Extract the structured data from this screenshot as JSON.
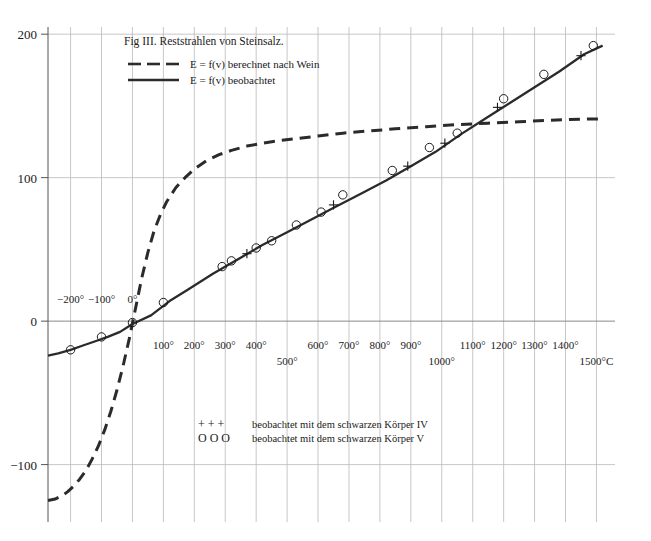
{
  "figure": {
    "title": "Fig III. Reststrahlen von Steinsalz.",
    "legend": [
      {
        "label": "E = f(v) berechnet nach Wein",
        "style": "dashed"
      },
      {
        "label": "E = f(v) beobachtet",
        "style": "solid"
      }
    ],
    "marker_legend": [
      {
        "glyphs": "+   +   +",
        "label": "beobachtet mit dem schwarzen Körper IV"
      },
      {
        "glyphs": "O   O   O",
        "label": "beobachtet mit dem schwarzen Körper V"
      }
    ],
    "axis_unit": "1500°C"
  },
  "chart_data": {
    "type": "line",
    "title": "Fig III. Reststrahlen von Steinsalz.",
    "xlabel": "",
    "ylabel": "",
    "xlim": [
      -273,
      1560
    ],
    "ylim": [
      -140,
      205
    ],
    "grid": true,
    "legend_position": "top-left",
    "y_ticks": [
      200,
      100,
      0,
      -100
    ],
    "y_tick_labels": [
      "200",
      "100",
      "0",
      "-100"
    ],
    "x_ticks": [
      -200,
      -100,
      0,
      100,
      200,
      300,
      400,
      500,
      600,
      700,
      800,
      900,
      1000,
      1100,
      1200,
      1300,
      1400,
      1500
    ],
    "x_tick_labels": [
      "−200°",
      "−100°",
      "0°",
      "100°",
      "200°",
      "300°",
      "400°",
      "500°",
      "600°",
      "700°",
      "800°",
      "900°",
      "1000°",
      "1100°",
      "1200°",
      "1300°",
      "1400°",
      "1500°C"
    ],
    "x_labels_above_axis": [
      "−200°",
      "−100°",
      "0°"
    ],
    "x_labels_staggered_low": [
      "500°",
      "1000°",
      "1500°C"
    ],
    "series": [
      {
        "name": "E = f(v) berechnet nach Wein",
        "style": "dashed",
        "x": [
          -273,
          -250,
          -230,
          -210,
          -190,
          -170,
          -150,
          -130,
          -110,
          -90,
          -70,
          -50,
          -30,
          -10,
          10,
          30,
          50,
          70,
          90,
          110,
          140,
          170,
          200,
          240,
          280,
          320,
          370,
          420,
          480,
          540,
          600,
          680,
          760,
          850,
          950,
          1050,
          1150,
          1250,
          1350,
          1450,
          1520
        ],
        "y": [
          -125,
          -124,
          -122,
          -119,
          -115,
          -110,
          -104,
          -96,
          -87,
          -76,
          -63,
          -48,
          -31,
          -12,
          9,
          30,
          48,
          63,
          74,
          83,
          93,
          100,
          106,
          112,
          116,
          119,
          122,
          124,
          126,
          127.5,
          129,
          131,
          132.5,
          134,
          135.5,
          137,
          138,
          139,
          140,
          140.8,
          141
        ]
      },
      {
        "name": "E = f(v) beobachtet",
        "style": "solid",
        "x": [
          -273,
          -240,
          -200,
          -160,
          -120,
          -80,
          -40,
          0,
          60,
          120,
          180,
          260,
          340,
          420,
          500,
          580,
          660,
          740,
          820,
          900,
          980,
          1060,
          1140,
          1220,
          1300,
          1380,
          1460,
          1520
        ],
        "y": [
          -24,
          -22.5,
          -20,
          -17,
          -14,
          -11,
          -7.5,
          -2,
          4,
          14,
          22,
          33,
          43,
          53,
          62,
          71,
          80,
          89,
          98,
          108,
          118,
          130,
          141,
          152,
          163,
          174,
          186,
          192
        ]
      }
    ],
    "points_circle": [
      {
        "x": -200,
        "y": -20
      },
      {
        "x": -100,
        "y": -11
      },
      {
        "x": 0,
        "y": -1
      },
      {
        "x": 100,
        "y": 13
      },
      {
        "x": 290,
        "y": 38
      },
      {
        "x": 320,
        "y": 42
      },
      {
        "x": 400,
        "y": 51
      },
      {
        "x": 450,
        "y": 56
      },
      {
        "x": 530,
        "y": 67
      },
      {
        "x": 610,
        "y": 76
      },
      {
        "x": 680,
        "y": 88
      },
      {
        "x": 840,
        "y": 105
      },
      {
        "x": 960,
        "y": 121
      },
      {
        "x": 1050,
        "y": 131
      },
      {
        "x": 1200,
        "y": 155
      },
      {
        "x": 1330,
        "y": 172
      },
      {
        "x": 1490,
        "y": 192
      }
    ],
    "points_plus": [
      {
        "x": 370,
        "y": 47
      },
      {
        "x": 650,
        "y": 81
      },
      {
        "x": 890,
        "y": 108
      },
      {
        "x": 1010,
        "y": 124
      },
      {
        "x": 1180,
        "y": 149
      },
      {
        "x": 1450,
        "y": 185
      }
    ]
  }
}
